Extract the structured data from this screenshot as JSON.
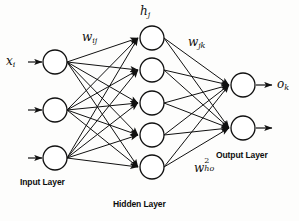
{
  "figure": {
    "type": "neural-network-diagram",
    "background_color": "#fdfdfc",
    "stroke_color": "#111111",
    "node_fill": "#ffffff"
  },
  "labels": {
    "input_signal": "x",
    "input_signal_sub": "i",
    "weight_input_hidden": "w",
    "weight_input_hidden_sub": "ij",
    "hidden_activation": "h",
    "hidden_activation_sub": "j",
    "weight_hidden_output": "w",
    "weight_hidden_output_sub": "jk",
    "weight_ho_base": "w",
    "weight_ho_sup": "2",
    "weight_ho_sub": "ho",
    "output_signal": "o",
    "output_signal_sub": "k",
    "input_layer": "Input Layer",
    "hidden_layer": "Hidden Layer",
    "output_layer": "Output Layer"
  },
  "network": {
    "layers": [
      {
        "name": "input",
        "label": "Input Layer",
        "node_count": 3,
        "cx": 55,
        "radius": 12,
        "cy_list": [
          62,
          110,
          158
        ]
      },
      {
        "name": "hidden",
        "label": "Hidden Layer",
        "node_count": 5,
        "cx": 152,
        "radius": 12,
        "cy_list": [
          38,
          70,
          103,
          135,
          167
        ]
      },
      {
        "name": "output",
        "label": "Output Layer",
        "node_count": 2,
        "cx": 243,
        "radius": 12,
        "cy_list": [
          85,
          128
        ]
      }
    ],
    "connections": "fully-connected",
    "input_arrows": 3,
    "output_arrows": 2
  }
}
